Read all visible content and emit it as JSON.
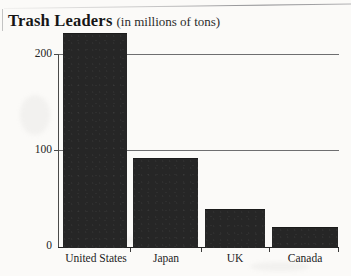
{
  "figure": {
    "title_main": "Trash Leaders",
    "title_sub": "(in millions of tons)"
  },
  "chart_data": {
    "type": "bar",
    "xlabel": "",
    "ylabel": "",
    "categories": [
      "United States",
      "Japan",
      "UK",
      "Canada"
    ],
    "values": [
      222,
      92,
      39,
      21
    ],
    "ylim": [
      0,
      230
    ],
    "yticks": [
      0,
      100,
      200
    ],
    "ytick_labels": [
      "0",
      "100",
      "200"
    ],
    "grid": "horizontal",
    "legend": "none",
    "bar_color": "#262626",
    "background_color": "#fbfaf8",
    "axis_color": "#242424",
    "gridline_color": "#6e6e70"
  }
}
